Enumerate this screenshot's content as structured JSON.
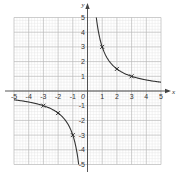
{
  "chart_data": {
    "type": "line",
    "title": "",
    "function": "y = 3/x",
    "xlabel": "x",
    "ylabel": "y",
    "xlim": [
      -5,
      5
    ],
    "ylim": [
      -5,
      5
    ],
    "grid": true,
    "x_ticks": [
      "-5",
      "-4",
      "-3",
      "-2",
      "-1",
      "1",
      "2",
      "3",
      "4",
      "5"
    ],
    "y_ticks": [
      "5",
      "4",
      "3",
      "2",
      "1",
      "-1",
      "-2",
      "-3",
      "-4",
      "-5"
    ],
    "origin_label": "0",
    "marked_points": [
      {
        "x": 1,
        "y": 3
      },
      {
        "x": 2,
        "y": 1.5
      },
      {
        "x": 3,
        "y": 1
      },
      {
        "x": -1,
        "y": -3
      },
      {
        "x": -2,
        "y": -1.5
      },
      {
        "x": -3,
        "y": -1
      }
    ],
    "series": [
      {
        "name": "y = 3/x (x > 0)",
        "x": [
          0.6,
          1,
          2,
          3,
          4,
          5
        ],
        "y": [
          5,
          3,
          1.5,
          1,
          0.75,
          0.6
        ]
      },
      {
        "name": "y = 3/x (x < 0)",
        "x": [
          -5,
          -4,
          -3,
          -2,
          -1,
          -0.6
        ],
        "y": [
          -0.6,
          -0.75,
          -1,
          -1.5,
          -3,
          -5
        ]
      }
    ]
  }
}
